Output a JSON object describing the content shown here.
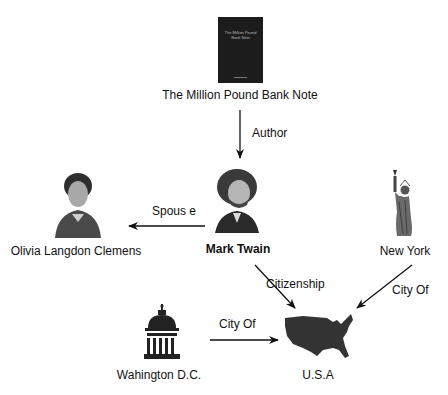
{
  "nodes": {
    "book": {
      "label": "The Million Pound Bank Note",
      "image": "book-cover",
      "cover_text": "The Million Pound Bank Note"
    },
    "twain": {
      "label": "Mark Twain",
      "image": "portrait-mark-twain"
    },
    "olivia": {
      "label": "Olivia Langdon Clemens",
      "image": "portrait-olivia"
    },
    "newyork": {
      "label": "New York",
      "image": "statue-of-liberty-icon"
    },
    "dc": {
      "label": "Wahington D.C.",
      "image": "capitol-building-icon"
    },
    "usa": {
      "label": "U.S.A",
      "image": "usa-map-icon"
    }
  },
  "edges": [
    {
      "from": "book",
      "to": "twain",
      "label": "Author"
    },
    {
      "from": "twain",
      "to": "olivia",
      "label": "Spous e"
    },
    {
      "from": "twain",
      "to": "usa",
      "label": "Citizenship"
    },
    {
      "from": "newyork",
      "to": "usa",
      "label": "City Of"
    },
    {
      "from": "dc",
      "to": "usa",
      "label": "City Of"
    }
  ],
  "colors": {
    "line": "#111111",
    "book_cover": "#1c1c1c"
  }
}
